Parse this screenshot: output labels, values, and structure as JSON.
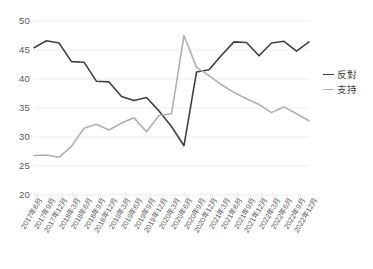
{
  "chart_data": {
    "type": "line",
    "title": "",
    "xlabel": "",
    "ylabel": "",
    "ylim": [
      20,
      50
    ],
    "yticks": [
      50,
      45,
      40,
      35,
      30,
      25,
      20
    ],
    "grid": true,
    "legend_position": "right",
    "categories": [
      "2017年6月",
      "2017年9月",
      "2017年12月",
      "2018年3月",
      "2018年6月",
      "2018年9月",
      "2018年12月",
      "2019年3月",
      "2019年6月",
      "2019年9月",
      "2019年12月",
      "2020年3月",
      "2020年6月",
      "2020年9月",
      "2020年12月",
      "2021年3月",
      "2021年6月",
      "2021年9月",
      "2021年12月",
      "2022年3月",
      "2022年6月",
      "2022年9月",
      "2022年12月"
    ],
    "series": [
      {
        "name": "反對",
        "color": "#404040",
        "values": [
          45.4,
          46.6,
          46.2,
          43.0,
          42.9,
          39.6,
          39.5,
          37.0,
          36.3,
          36.8,
          34.5,
          31.8,
          28.5,
          41.2,
          41.6,
          44.1,
          46.4,
          46.3,
          44.0,
          46.2,
          46.5,
          44.8,
          46.4
        ]
      },
      {
        "name": "支持",
        "color": "#b0b0b0",
        "values": [
          26.8,
          26.9,
          26.5,
          28.4,
          31.5,
          32.2,
          31.2,
          32.4,
          33.3,
          30.9,
          33.7,
          34.0,
          47.5,
          42.0,
          40.6,
          39.0,
          37.7,
          36.6,
          35.6,
          34.2,
          35.2,
          34.0,
          32.8
        ]
      }
    ]
  },
  "legend": {
    "items": [
      {
        "label": "反對",
        "color": "#404040"
      },
      {
        "label": "支持",
        "color": "#b0b0b0"
      }
    ]
  }
}
